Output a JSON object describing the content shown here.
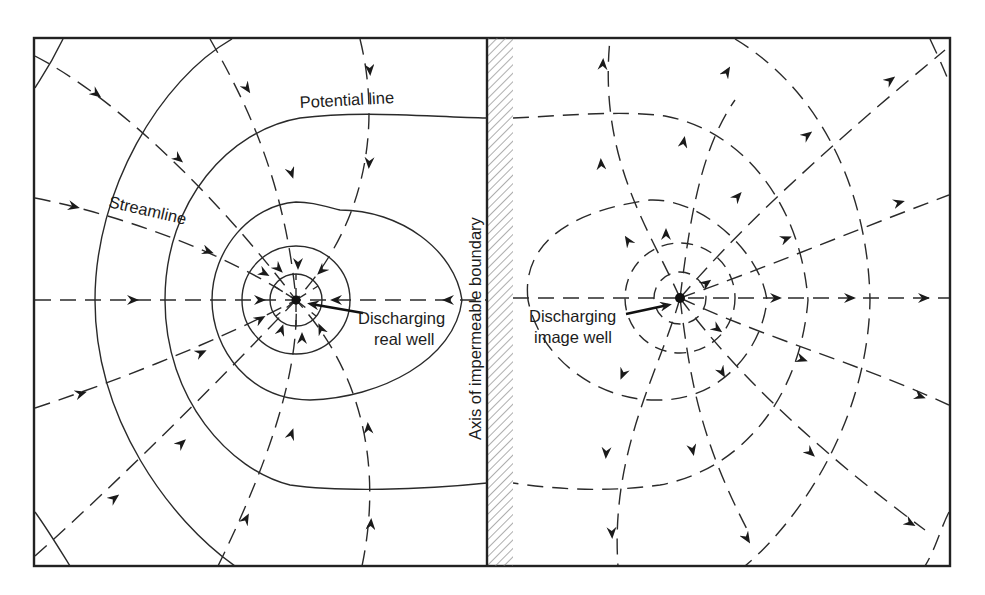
{
  "figure": {
    "labels": {
      "potential_line": "Potential line",
      "streamline": "Streamline",
      "real_well_line1": "Discharging",
      "real_well_line2": "real well",
      "image_well_line1": "Discharging",
      "image_well_line2": "image well",
      "boundary_axis": "Axis of impermeable boundary"
    },
    "colors": {
      "line": "#2a2a2a",
      "background": "#ffffff",
      "hatch": "#777777"
    },
    "elements": {
      "real_well": {
        "x": 296,
        "y": 300,
        "flow": "inward"
      },
      "image_well": {
        "x": 680,
        "y": 298,
        "flow": "outward"
      },
      "boundary_x": 487
    }
  }
}
